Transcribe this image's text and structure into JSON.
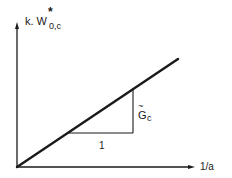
{
  "diagram": {
    "type": "line-plot-sketch",
    "y_axis": {
      "label_prefix": "k. W",
      "label_sup": "*",
      "label_sub": "0,c"
    },
    "x_axis": {
      "label": "1/a"
    },
    "slope_triangle": {
      "run_label": "1",
      "rise_label_base": "G",
      "rise_label_accent": "~",
      "rise_label_sub": "c"
    },
    "colors": {
      "ink": "#1a1a1a",
      "background": "#ffffff"
    }
  }
}
